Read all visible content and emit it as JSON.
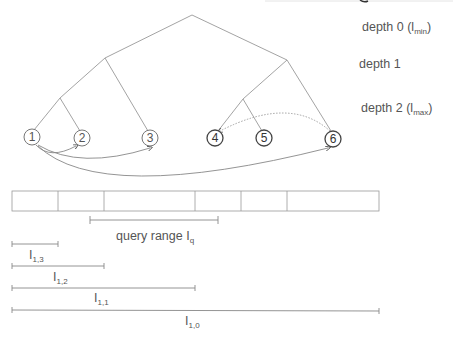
{
  "tree": {
    "depth_labels": [
      {
        "text": "depth 0 (l",
        "sub": "min",
        "close": ")"
      },
      {
        "text": "depth 1",
        "sub": "",
        "close": ""
      },
      {
        "text": "depth 2 (l",
        "sub": "max",
        "close": ")"
      }
    ],
    "nodes": [
      {
        "id": "1",
        "label": "1"
      },
      {
        "id": "2",
        "label": "2"
      },
      {
        "id": "3",
        "label": "3"
      },
      {
        "id": "4",
        "label": "4"
      },
      {
        "id": "5",
        "label": "5"
      },
      {
        "id": "6",
        "label": "6"
      }
    ],
    "arrows": [
      {
        "from": "1",
        "to": "2",
        "style": "solid"
      },
      {
        "from": "1",
        "to": "3",
        "style": "solid"
      },
      {
        "from": "1",
        "to": "6",
        "style": "solid"
      },
      {
        "from": "6",
        "to": "4",
        "style": "dotted"
      }
    ]
  },
  "array": {
    "cell_count": 6
  },
  "ranges": {
    "query": {
      "text": "query range I",
      "sub": "q"
    },
    "intervals": [
      {
        "text": "I",
        "sub": "1,3"
      },
      {
        "text": "I",
        "sub": "1,2"
      },
      {
        "text": "I",
        "sub": "1,1"
      },
      {
        "text": "I",
        "sub": "1,0"
      }
    ]
  },
  "colors": {
    "line": "#8a8a8a",
    "node_stroke_light": "#777777",
    "node_stroke_dark": "#444444",
    "text": "#555555"
  }
}
